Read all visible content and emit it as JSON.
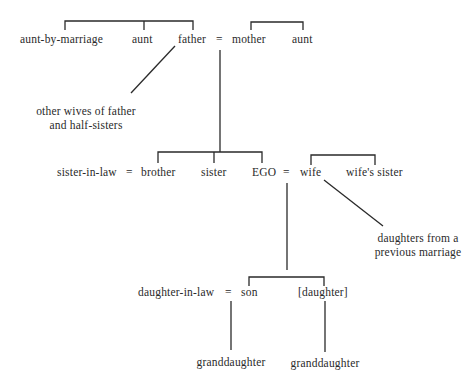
{
  "diagram": {
    "type": "kinship-chart",
    "generations": [
      {
        "level": "parents",
        "nodes": [
          {
            "id": "aunt_by_marriage",
            "label": "aunt-by-marriage"
          },
          {
            "id": "aunt_paternal",
            "label": "aunt"
          },
          {
            "id": "father",
            "label": "father"
          },
          {
            "id": "eq_parents",
            "label": "="
          },
          {
            "id": "mother",
            "label": "mother"
          },
          {
            "id": "aunt_maternal",
            "label": "aunt"
          }
        ],
        "annotation": {
          "line1": "other wives of father",
          "line2": "and half-sisters",
          "links_to": "father"
        }
      },
      {
        "level": "ego",
        "nodes": [
          {
            "id": "sister_in_law",
            "label": "sister-in-law"
          },
          {
            "id": "eq_brother",
            "label": "="
          },
          {
            "id": "brother",
            "label": "brother"
          },
          {
            "id": "sister",
            "label": "sister"
          },
          {
            "id": "ego",
            "label": "EGO"
          },
          {
            "id": "eq_ego",
            "label": "="
          },
          {
            "id": "wife",
            "label": "wife"
          },
          {
            "id": "wifes_sister",
            "label": "wife's sister"
          }
        ],
        "annotation": {
          "line1": "daughters from a",
          "line2": "previous marriage",
          "links_to": "wife"
        }
      },
      {
        "level": "children",
        "nodes": [
          {
            "id": "daughter_in_law",
            "label": "daughter-in-law"
          },
          {
            "id": "eq_son",
            "label": "="
          },
          {
            "id": "son",
            "label": "son"
          },
          {
            "id": "daughter",
            "label": "[daughter]"
          }
        ]
      },
      {
        "level": "grandchildren",
        "nodes": [
          {
            "id": "granddaughter_1",
            "label": "granddaughter"
          },
          {
            "id": "granddaughter_2",
            "label": "granddaughter"
          }
        ]
      }
    ],
    "edges": [
      {
        "type": "sibling-bracket",
        "members": [
          "aunt_by_marriage",
          "aunt_paternal",
          "father"
        ]
      },
      {
        "type": "sibling-bracket",
        "members": [
          "mother",
          "aunt_maternal"
        ]
      },
      {
        "type": "descent",
        "from": "father=mother",
        "to": [
          "brother",
          "sister",
          "ego"
        ]
      },
      {
        "type": "sibling-bracket",
        "members": [
          "wife",
          "wifes_sister"
        ]
      },
      {
        "type": "descent",
        "from": "ego=wife",
        "to": [
          "son",
          "daughter"
        ]
      },
      {
        "type": "descent",
        "from": "daughter_in_law=son",
        "to": [
          "granddaughter_1"
        ]
      },
      {
        "type": "descent",
        "from": "daughter",
        "to": [
          "granddaughter_2"
        ]
      },
      {
        "type": "annotation-link",
        "from": "father",
        "to": "other wives of father and half-sisters"
      },
      {
        "type": "annotation-link",
        "from": "wife",
        "to": "daughters from a previous marriage"
      }
    ],
    "colors": {
      "line": "#2a2a2a",
      "text": "#2a2a2a",
      "background": "#ffffff"
    }
  }
}
